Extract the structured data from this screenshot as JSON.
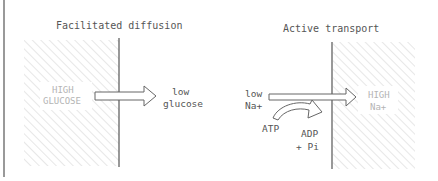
{
  "diagram": {
    "left_panel": {
      "title": "Facilitated diffusion",
      "high_label_line1": "HIGH",
      "high_label_line2": "GLUCOSE",
      "low_label_line1": "low",
      "low_label_line2": "glucose"
    },
    "right_panel": {
      "title": "Active transport",
      "low_label_line1": "low",
      "low_label_line2": "Na+",
      "high_label_line1": "HIGH",
      "high_label_line2": "Na+",
      "atp_label": "ATP",
      "adp_label": "ADP",
      "pi_label": "+ Pi"
    },
    "colors": {
      "line": "#555555",
      "hatch": "#c8c8c8",
      "faint_text": "#b4b4b4"
    }
  }
}
